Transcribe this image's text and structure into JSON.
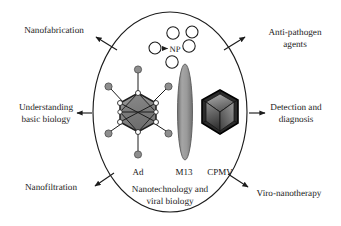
{
  "figure": {
    "background_color": "#ffffff",
    "outline_color": "#1c1c1c"
  },
  "center": {
    "caption_line1": "Nanotechnology and",
    "caption_line2": "viral biology",
    "ellipse": {
      "cx": 170,
      "cy": 112,
      "rx": 77,
      "ry": 100
    }
  },
  "nanoparticles": {
    "label": "NP",
    "fill_color": "#ffffff",
    "stroke_color": "#1c1c1c",
    "circles": [
      {
        "cx": 155,
        "cy": 48,
        "r": 6.0
      },
      {
        "cx": 173,
        "cy": 33,
        "r": 6.2
      },
      {
        "cx": 192,
        "cy": 32,
        "r": 6.0
      },
      {
        "cx": 189,
        "cy": 45,
        "r": 6.2
      },
      {
        "cx": 172,
        "cy": 62,
        "r": 6.2
      }
    ]
  },
  "viruses": [
    {
      "id": "adenovirus",
      "label": "Ad",
      "label_x": 138,
      "label_y": 172,
      "body_fill": "#8c8c8c",
      "body_stroke": "#1c1c1c",
      "fiber_knob_fill": "#8e8e8e",
      "vertex_fill": "#ffffff"
    },
    {
      "id": "m13",
      "label": "M13",
      "label_x": 183,
      "label_y": 172,
      "body_fill": "#9b9b9b",
      "body_stroke": "#4a4a4a"
    },
    {
      "id": "cpmv",
      "label": "CPMV",
      "label_x": 217,
      "label_y": 172,
      "body_fill": "#2a2a2a",
      "body_stroke": "#000000",
      "facet_light": "#9a9a9a",
      "facet_mid": "#6a6a6a",
      "facet_dark": "#3a3a3a"
    }
  ],
  "applications": [
    {
      "id": "nanofabrication",
      "lines": [
        "Nanofabrication"
      ],
      "text_x": 54,
      "text_y": 42,
      "anchor": "middle",
      "arrow": {
        "x1": 117,
        "x2": 95,
        "y1": 50,
        "y2": 37
      }
    },
    {
      "id": "understanding-basic-biology",
      "lines": [
        "Understanding",
        "basic biology"
      ],
      "text_x": 46,
      "text_y": 110,
      "anchor": "middle",
      "arrow": {
        "x1": 92,
        "x2": 76,
        "y1": 113,
        "y2": 113
      }
    },
    {
      "id": "nanofiltration",
      "lines": [
        "Nanofiltration"
      ],
      "text_x": 51,
      "text_y": 187,
      "anchor": "middle",
      "arrow": {
        "x1": 114,
        "x2": 93,
        "y1": 173,
        "y2": 187
      }
    },
    {
      "id": "anti-pathogen-agents",
      "lines": [
        "Anti-pathogen",
        "agents"
      ],
      "text_x": 295,
      "text_y": 42,
      "anchor": "middle",
      "arrow": {
        "x1": 224,
        "x2": 246,
        "y1": 50,
        "y2": 37
      }
    },
    {
      "id": "detection-and-diagnosis",
      "lines": [
        "Detection and",
        "diagnosis"
      ],
      "text_x": 296,
      "text_y": 110,
      "anchor": "middle",
      "arrow": {
        "x1": 249,
        "x2": 266,
        "y1": 113,
        "y2": 113
      }
    },
    {
      "id": "viro-nanotherapy",
      "lines": [
        "Viro-nanotherapy"
      ],
      "text_x": 291,
      "text_y": 192,
      "anchor": "middle",
      "arrow": {
        "x1": 228,
        "x2": 249,
        "y1": 174,
        "y2": 188
      }
    }
  ]
}
